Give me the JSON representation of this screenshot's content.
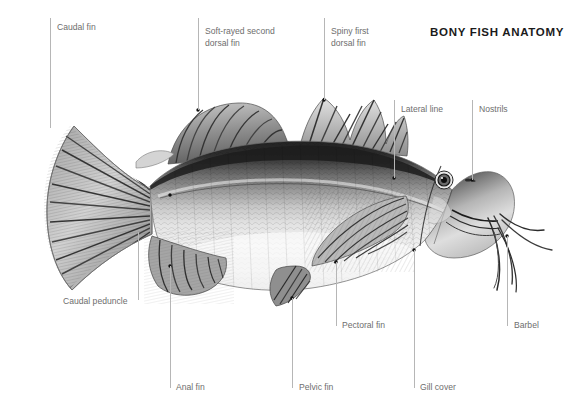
{
  "page": {
    "title": "BONY FISH ANATOMY",
    "background_color": "#ffffff",
    "width": 575,
    "height": 420
  },
  "illustration": {
    "subject": "bony-fish",
    "description": "Grayscale airbrush illustration of a bony fish in left lateral view, head to the right",
    "ink_dark": "#262626",
    "ink_mid": "#8d8d8d",
    "ink_light": "#e8e8e8"
  },
  "labels": [
    {
      "id": "caudal-fin",
      "text": "Caudal fin",
      "x": 57,
      "y": 22,
      "leader": {
        "x": 50,
        "y1": 18,
        "y2": 128
      }
    },
    {
      "id": "soft-rayed-second-dorsal",
      "text": "Soft-rayed second\ndorsal fin",
      "x": 205,
      "y": 26,
      "leader": {
        "x": 198,
        "y1": 18,
        "y2": 110
      }
    },
    {
      "id": "spiny-first-dorsal",
      "text": "Spiny first\ndorsal fin",
      "x": 331,
      "y": 26,
      "leader": {
        "x": 324,
        "y1": 18,
        "y2": 100
      }
    },
    {
      "id": "lateral-line",
      "text": "Lateral line",
      "x": 401,
      "y": 104,
      "leader": {
        "x": 394,
        "y1": 100,
        "y2": 178
      }
    },
    {
      "id": "nostrils",
      "text": "Nostrils",
      "x": 479,
      "y": 104,
      "leader": {
        "x": 472,
        "y1": 100,
        "y2": 180
      }
    },
    {
      "id": "caudal-peduncle",
      "text": "Caudal peduncle",
      "x": 63,
      "y": 296,
      "leader": {
        "x": 138,
        "y1": 232,
        "y2": 300
      }
    },
    {
      "id": "anal-fin",
      "text": "Anal fin",
      "x": 176,
      "y": 382,
      "leader": {
        "x": 170,
        "y1": 266,
        "y2": 388
      }
    },
    {
      "id": "pelvic-fin",
      "text": "Pelvic fin",
      "x": 299,
      "y": 382,
      "leader": {
        "x": 292,
        "y1": 298,
        "y2": 388
      }
    },
    {
      "id": "pectoral-fin",
      "text": "Pectoral fin",
      "x": 342,
      "y": 320,
      "leader": {
        "x": 336,
        "y1": 262,
        "y2": 326
      }
    },
    {
      "id": "gill-cover",
      "text": "Gill cover",
      "x": 420,
      "y": 382,
      "leader": {
        "x": 414,
        "y1": 250,
        "y2": 388
      }
    },
    {
      "id": "barbel",
      "text": "Barbel",
      "x": 514,
      "y": 320,
      "leader": {
        "x": 507,
        "y1": 236,
        "y2": 326
      }
    }
  ]
}
